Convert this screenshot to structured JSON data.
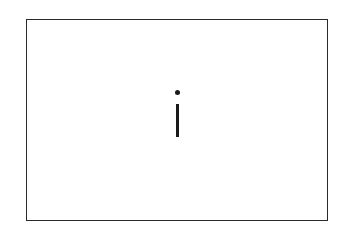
{
  "card": {
    "glyph": "i",
    "border_color": "#2a2a2a",
    "glyph_color": "#1a1a1a",
    "background": "#ffffff"
  }
}
